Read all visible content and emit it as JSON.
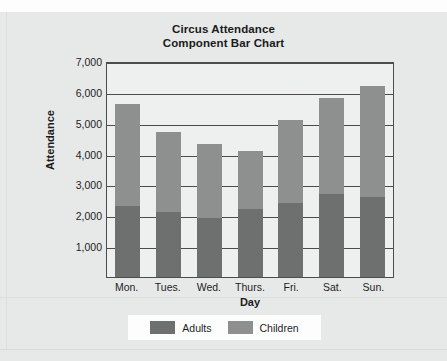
{
  "chart_data": {
    "type": "bar",
    "subtype": "stacked",
    "title": "Circus Attendance",
    "subtitle": "Component Bar Chart",
    "xlabel": "Day",
    "ylabel": "Attendance",
    "categories": [
      "Mon.",
      "Tues.",
      "Wed.",
      "Thurs.",
      "Fri.",
      "Sat.",
      "Sun."
    ],
    "series": [
      {
        "name": "Adults",
        "color": "#6e6f6f",
        "values": [
          2300,
          2100,
          1900,
          2200,
          2400,
          2700,
          2600
        ]
      },
      {
        "name": "Children",
        "color": "#8e8f8f",
        "values": [
          3300,
          2600,
          2400,
          1900,
          2700,
          3100,
          3600
        ]
      }
    ],
    "totals": [
      5600,
      4700,
      4300,
      4100,
      5100,
      5800,
      6200
    ],
    "ylim": [
      0,
      7000
    ],
    "ytick_labels": [
      "7,000",
      "6,000",
      "5,000",
      "4,000",
      "3,000",
      "2,000",
      "1,000"
    ],
    "ytick_values": [
      7000,
      6000,
      5000,
      4000,
      3000,
      2000,
      1000
    ],
    "grid": true,
    "legend_position": "bottom"
  },
  "legend": {
    "entries": [
      {
        "label": "Adults",
        "color": "#6e6f6f"
      },
      {
        "label": "Children",
        "color": "#8e8f8f"
      }
    ]
  },
  "colors": {
    "adults": "#6e6f6f",
    "children": "#8e8f8f",
    "page_background": "#e7e8e8",
    "plot_background": "#eeefef",
    "axis": "#4b4c4c",
    "text": "#1b1b1b"
  }
}
